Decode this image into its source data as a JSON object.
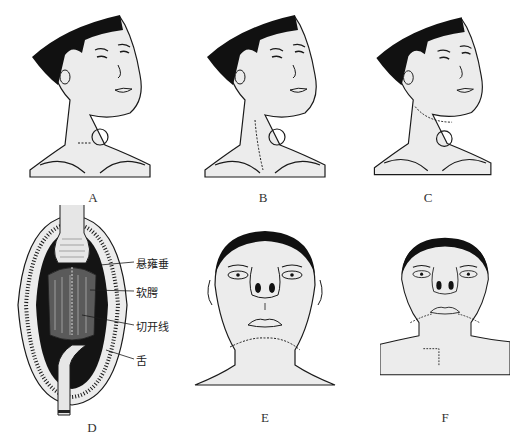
{
  "figure": {
    "panels": [
      {
        "id": "A",
        "label": "A",
        "description": "Head tilted, neck with circular lesion and horizontal incision line"
      },
      {
        "id": "B",
        "label": "B",
        "description": "Head tilted, neck with circular lesion and vertical dashed incision along sternocleidomastoid"
      },
      {
        "id": "C",
        "label": "C",
        "description": "Head tilted, neck with circular lesion and submandibular curved dashed incision"
      },
      {
        "id": "D",
        "label": "D",
        "description": "Open mouth intraoral view with tongue depressor"
      },
      {
        "id": "E",
        "label": "E",
        "description": "Frontal face, submental curved dashed incision"
      },
      {
        "id": "F",
        "label": "F",
        "description": "Frontal face, submandibular and L-shaped dashed neck incisions"
      }
    ],
    "callouts_D": [
      {
        "text": "悬雍垂",
        "meaning": "uvula"
      },
      {
        "text": "软腭",
        "meaning": "soft palate"
      },
      {
        "text": "切开线",
        "meaning": "incision line"
      },
      {
        "text": "舌",
        "meaning": "tongue"
      }
    ],
    "colors": {
      "ink": "#1a1a1a",
      "skin": "#ececec",
      "hair": "#111111",
      "background": "#ffffff"
    }
  }
}
